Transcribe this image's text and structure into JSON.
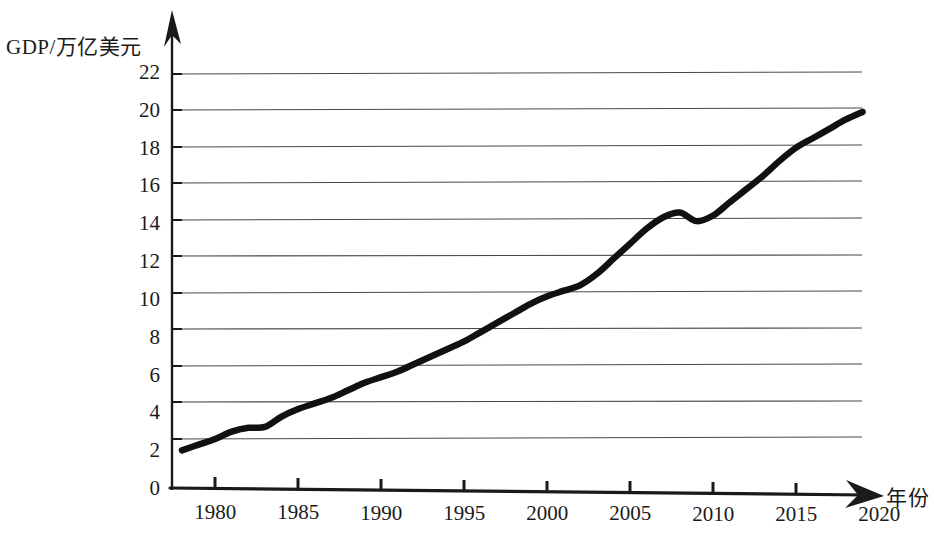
{
  "chart_data": {
    "type": "line",
    "title": "",
    "ylabel": "GDP/万亿美元",
    "xlabel": "年份",
    "xlim": [
      1977.5,
      2020
    ],
    "ylim": [
      0,
      23
    ],
    "grid": true,
    "legend": "none",
    "y_ticks": [
      0,
      2,
      4,
      6,
      8,
      10,
      12,
      14,
      16,
      18,
      20,
      22
    ],
    "x_ticks": [
      1980,
      1985,
      1990,
      1995,
      2000,
      2005,
      2010,
      2015,
      2020
    ],
    "series": [
      {
        "name": "GDP",
        "color": "#111111",
        "x": [
          1978,
          1979,
          1980,
          1981,
          1982,
          1983,
          1984,
          1985,
          1986,
          1987,
          1988,
          1989,
          1990,
          1991,
          1992,
          1993,
          1994,
          1995,
          1996,
          1997,
          1998,
          1999,
          2000,
          2001,
          2002,
          2003,
          2004,
          2005,
          2006,
          2007,
          2008,
          2009,
          2010,
          2011,
          2012,
          2013,
          2014,
          2015,
          2016,
          2017,
          2018,
          2019
        ],
        "values": [
          2.1,
          2.4,
          2.7,
          3.1,
          3.3,
          3.35,
          3.9,
          4.3,
          4.6,
          4.9,
          5.3,
          5.7,
          6.0,
          6.3,
          6.7,
          7.1,
          7.5,
          7.9,
          8.4,
          8.9,
          9.4,
          9.9,
          10.3,
          10.6,
          10.9,
          11.5,
          12.3,
          13.1,
          13.9,
          14.5,
          14.75,
          14.3,
          14.6,
          15.3,
          16.0,
          16.7,
          17.5,
          18.2,
          18.7,
          19.2,
          19.7,
          20.1
        ]
      }
    ]
  }
}
